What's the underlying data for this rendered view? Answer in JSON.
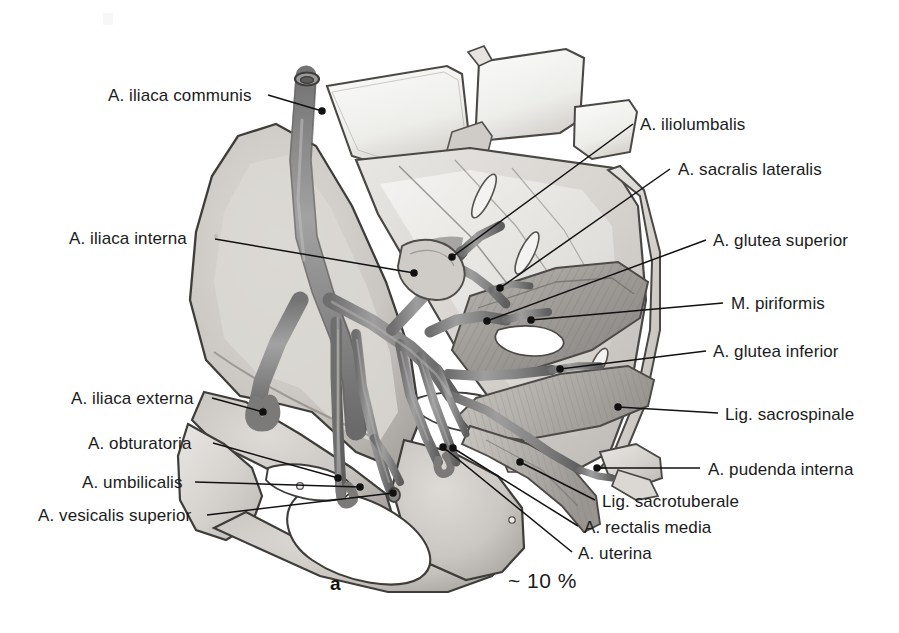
{
  "figure": {
    "caption_letter": "a",
    "caption_percentage": "~ 10 %",
    "background_color": "#ffffff",
    "ink_color": "#1b1b1b",
    "vessel_fill": "#8d8d8d",
    "bone_fill": "#d8d6d2",
    "muscle_fill": "#a9a7a2"
  },
  "labels_left": [
    {
      "id": "a-iliaca-communis",
      "text": "A. iliaca communis",
      "name": "label-a-iliaca-communis",
      "x": 108,
      "y": 86,
      "leader": {
        "x1": 268,
        "y1": 95,
        "x2": 322,
        "y2": 111,
        "dot": true
      }
    },
    {
      "id": "a-iliaca-interna",
      "text": "A. iliaca interna",
      "name": "label-a-iliaca-interna",
      "x": 69,
      "y": 229,
      "leader": {
        "x1": 215,
        "y1": 239,
        "x2": 414,
        "y2": 273,
        "dot": true
      }
    },
    {
      "id": "a-iliaca-externa",
      "text": "A. iliaca externa",
      "name": "label-a-iliaca-externa",
      "x": 71,
      "y": 389,
      "leader": {
        "x1": 212,
        "y1": 398,
        "x2": 263,
        "y2": 412,
        "dot": true
      }
    },
    {
      "id": "a-obturatoria",
      "text": "A. obturatoria",
      "name": "label-a-obturatoria",
      "x": 88,
      "y": 434,
      "leader": {
        "x1": 213,
        "y1": 443,
        "x2": 338,
        "y2": 478,
        "dot": true
      }
    },
    {
      "id": "a-umbilicalis",
      "text": "A. umbilicalis",
      "name": "label-a-umbilicalis",
      "x": 82,
      "y": 473,
      "leader": {
        "x1": 195,
        "y1": 482,
        "x2": 360,
        "y2": 487,
        "dot": true
      }
    },
    {
      "id": "a-vesicalis-superior",
      "text": "A. vesicalis superior",
      "name": "label-a-vesicalis-superior",
      "x": 38,
      "y": 506,
      "leader": {
        "x1": 207,
        "y1": 515,
        "x2": 393,
        "y2": 493,
        "dot": true
      }
    }
  ],
  "labels_right": [
    {
      "id": "a-iliolumbalis",
      "text": "A. iliolumbalis",
      "name": "label-a-iliolumbalis",
      "x": 640,
      "y": 115,
      "leader": {
        "x1": 633,
        "y1": 124,
        "x2": 452,
        "y2": 257,
        "dot": true
      }
    },
    {
      "id": "a-sacralis-lateralis",
      "text": "A. sacralis lateralis",
      "name": "label-a-sacralis-lateralis",
      "x": 678,
      "y": 160,
      "leader": {
        "x1": 670,
        "y1": 169,
        "x2": 500,
        "y2": 288,
        "dot": true
      }
    },
    {
      "id": "a-glutea-superior",
      "text": "A. glutea superior",
      "name": "label-a-glutea-superior",
      "x": 713,
      "y": 231,
      "leader": {
        "x1": 706,
        "y1": 240,
        "x2": 487,
        "y2": 321,
        "dot": true
      }
    },
    {
      "id": "m-piriformis",
      "text": "M. piriformis",
      "name": "label-m-piriformis",
      "x": 731,
      "y": 294,
      "leader": {
        "x1": 723,
        "y1": 303,
        "x2": 531,
        "y2": 320,
        "dot": true
      }
    },
    {
      "id": "a-glutea-inferior",
      "text": "A. glutea inferior",
      "name": "label-a-glutea-inferior",
      "x": 713,
      "y": 342,
      "leader": {
        "x1": 706,
        "y1": 351,
        "x2": 560,
        "y2": 369,
        "dot": true
      }
    },
    {
      "id": "lig-sacrospinale",
      "text": "Lig. sacrospinale",
      "name": "label-lig-sacrospinale",
      "x": 725,
      "y": 405,
      "leader": {
        "x1": 718,
        "y1": 413,
        "x2": 618,
        "y2": 407,
        "dot": true
      }
    },
    {
      "id": "a-pudenda-interna",
      "text": "A. pudenda interna",
      "name": "label-a-pudenda-interna",
      "x": 708,
      "y": 460,
      "leader": {
        "x1": 700,
        "y1": 468,
        "x2": 597,
        "y2": 468,
        "dot": true
      }
    },
    {
      "id": "lig-sacrotuberale",
      "text": "Lig. sacrotuberale",
      "name": "label-lig-sacrotuberale",
      "x": 602,
      "y": 492,
      "leader": {
        "x1": 595,
        "y1": 500,
        "x2": 520,
        "y2": 462,
        "dot": true
      }
    },
    {
      "id": "a-rectalis-media",
      "text": "A. rectalis media",
      "name": "label-a-rectalis-media",
      "x": 584,
      "y": 518,
      "leader": {
        "x1": 578,
        "y1": 526,
        "x2": 453,
        "y2": 448,
        "dot": true
      }
    },
    {
      "id": "a-uterina",
      "text": "A. uterina",
      "name": "label-a-uterina",
      "x": 578,
      "y": 544,
      "leader": {
        "x1": 572,
        "y1": 552,
        "x2": 443,
        "y2": 447,
        "dot": true
      }
    }
  ]
}
